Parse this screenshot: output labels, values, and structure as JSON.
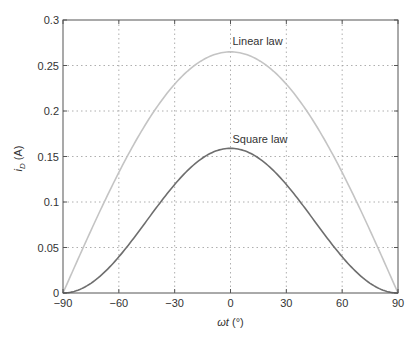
{
  "chart_data": {
    "type": "line",
    "title": "",
    "xlabel": "ωt (°)",
    "xlabel_parts": {
      "omega": "ω",
      "t": "t",
      "unit": " (°)"
    },
    "ylabel": "i_D (A)",
    "ylabel_parts": {
      "i": "i",
      "sub": "D",
      "unit": " (A)"
    },
    "xlim": [
      -90,
      90
    ],
    "ylim": [
      0,
      0.3
    ],
    "xticks": [
      -90,
      -60,
      -30,
      0,
      30,
      60,
      90
    ],
    "xtick_labels": [
      "−90",
      "−60",
      "−30",
      "0",
      "30",
      "60",
      "90"
    ],
    "yticks": [
      0,
      0.05,
      0.1,
      0.15,
      0.2,
      0.25,
      0.3
    ],
    "ytick_labels": [
      "0",
      "0.05",
      "0.1",
      "0.15",
      "0.2",
      "0.25",
      "0.3"
    ],
    "grid": true,
    "legend": "none",
    "x": [
      -90,
      -75,
      -60,
      -45,
      -30,
      -15,
      0,
      15,
      30,
      45,
      60,
      75,
      90
    ],
    "series": [
      {
        "name": "Linear law",
        "color": "#c4c4c4",
        "values": [
          0,
          0.0686,
          0.1325,
          0.1874,
          0.2295,
          0.256,
          0.265,
          0.256,
          0.2295,
          0.1874,
          0.1325,
          0.0686,
          0
        ]
      },
      {
        "name": "Square law",
        "color": "#6e6e6e",
        "values": [
          0,
          0.0107,
          0.0398,
          0.0795,
          0.1193,
          0.1484,
          0.159,
          0.1484,
          0.1193,
          0.0795,
          0.0398,
          0.0107,
          0
        ]
      }
    ],
    "annotations": [
      {
        "text": "Linear law",
        "x": 0,
        "y": 0.272
      },
      {
        "text": "Square law",
        "x": 0,
        "y": 0.165
      }
    ]
  },
  "style": {
    "axis_color": "#555555",
    "grid_color": "#9a9a9a",
    "text_color": "#333333"
  }
}
